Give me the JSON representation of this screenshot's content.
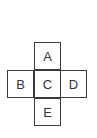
{
  "diagram": {
    "type": "cube-net-cross",
    "cells": {
      "top": "A",
      "left": "B",
      "center": "C",
      "right": "D",
      "bottom": "E"
    }
  }
}
